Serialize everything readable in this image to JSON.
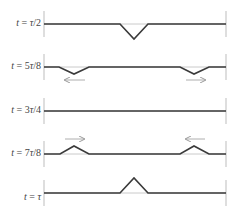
{
  "figure": {
    "axis_left_x": 44,
    "axis_right_x": 226,
    "colors": {
      "wave": "#3a3a3a",
      "equilibrium": "#bdbdbd",
      "axis": "#bdbdbd",
      "arrow": "#9a9a9a",
      "label": "#444444"
    },
    "panels": [
      {
        "label": "t = τ/2",
        "baseline_y": 24,
        "points": [
          [
            44,
            24
          ],
          [
            120,
            24
          ],
          [
            134,
            39
          ],
          [
            148,
            24
          ],
          [
            226,
            24
          ]
        ],
        "arrows": []
      },
      {
        "label": "t = 5τ/8",
        "baseline_y": 67,
        "points": [
          [
            44,
            67
          ],
          [
            59,
            67
          ],
          [
            74,
            74
          ],
          [
            89,
            67
          ],
          [
            180,
            67
          ],
          [
            194,
            74
          ],
          [
            209,
            67
          ],
          [
            226,
            67
          ]
        ],
        "arrows": [
          {
            "from": 85,
            "to": 65,
            "y": 80,
            "direction": "left"
          },
          {
            "from": 186,
            "to": 205,
            "y": 80,
            "direction": "right"
          }
        ]
      },
      {
        "label": "t = 3τ/4",
        "baseline_y": 111,
        "points": [
          [
            44,
            111
          ],
          [
            226,
            111
          ]
        ],
        "arrows": []
      },
      {
        "label": "t = 7τ/8",
        "baseline_y": 154,
        "points": [
          [
            44,
            154
          ],
          [
            60,
            154
          ],
          [
            74,
            146
          ],
          [
            89,
            154
          ],
          [
            180,
            154
          ],
          [
            194,
            146
          ],
          [
            209,
            154
          ],
          [
            226,
            154
          ]
        ],
        "arrows": [
          {
            "from": 65,
            "to": 84,
            "y": 139,
            "direction": "right"
          },
          {
            "from": 205,
            "to": 186,
            "y": 139,
            "direction": "left"
          }
        ]
      },
      {
        "label": "t = τ",
        "baseline_y": 193,
        "points": [
          [
            44,
            193
          ],
          [
            120,
            193
          ],
          [
            134,
            178
          ],
          [
            148,
            193
          ],
          [
            226,
            193
          ]
        ],
        "arrows": []
      }
    ]
  }
}
